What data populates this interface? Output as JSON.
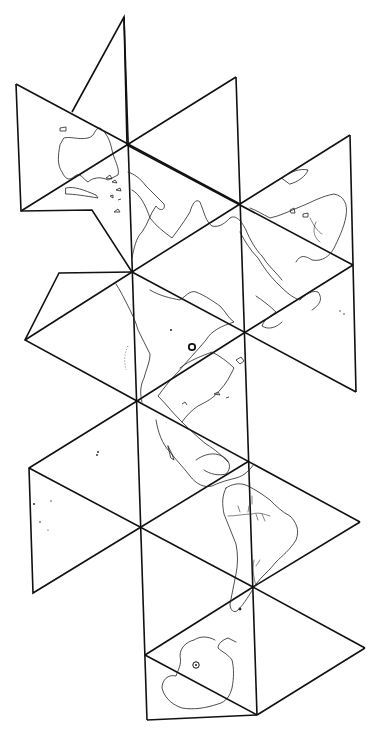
{
  "map": {
    "kind": "Dymaxion (icosahedral) world map outline",
    "style": "black line drawing on white",
    "colors": {
      "background": "#ffffff",
      "edges": "#111111",
      "coastlines": "#222222"
    },
    "markers": [
      {
        "name": "north-pole",
        "symbol": "ring"
      },
      {
        "name": "south-pole",
        "symbol": "ring"
      }
    ],
    "landmasses": [
      "North America",
      "Greenland",
      "Eurasia",
      "Africa",
      "South America",
      "Antarctica",
      "Australia"
    ],
    "labels": []
  }
}
